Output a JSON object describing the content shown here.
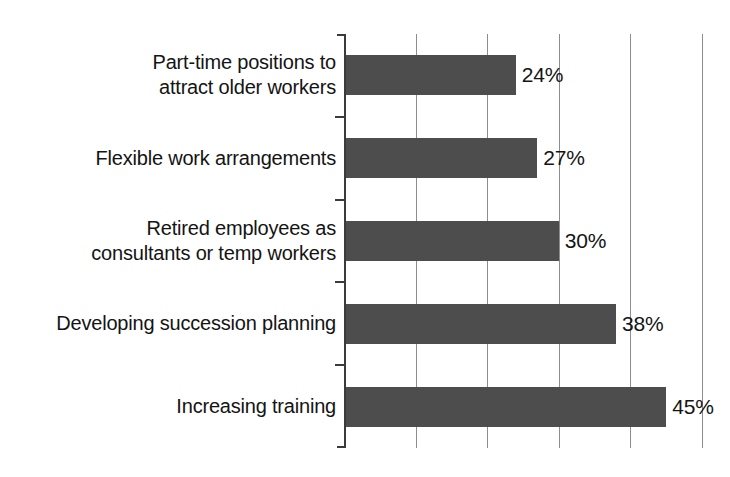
{
  "chart_data": {
    "type": "bar",
    "orientation": "horizontal",
    "title": "",
    "subtitle": "",
    "xlabel": "",
    "ylabel": "",
    "categories": [
      "Part-time positions to\nattract older workers",
      "Flexible work arrangements",
      "Retired employees as\nconsultants or temp workers",
      "Developing succession planning",
      "Increasing training"
    ],
    "values": [
      24,
      27,
      30,
      38,
      45
    ],
    "value_labels": [
      "24%",
      "27%",
      "30%",
      "38%",
      "45%"
    ],
    "xlim": [
      0,
      50
    ],
    "xticks": [
      10,
      20,
      30,
      40,
      50
    ],
    "xtick_labels": [
      "",
      "",
      "",
      "",
      ""
    ],
    "grid": "vertical-only",
    "legend": "none",
    "series": [
      {
        "name": "Percent of employers",
        "values": [
          24,
          27,
          30,
          38,
          45
        ]
      }
    ],
    "colors": {
      "bar": "#4d4d4d",
      "gridline": "#8d8d8d",
      "axis": "#3b3b3b",
      "text": "#141414",
      "background": "#ffffff"
    }
  }
}
